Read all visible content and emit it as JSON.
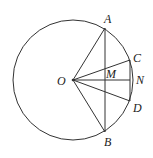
{
  "diagram": {
    "type": "geometry-circle",
    "circle": {
      "center": "O",
      "cx": 73,
      "cy": 80,
      "r": 60
    },
    "points": {
      "O": {
        "x": 73,
        "y": 80,
        "label": "O"
      },
      "A": {
        "x": 105,
        "y": 28,
        "label": "A"
      },
      "B": {
        "x": 105,
        "y": 132,
        "label": "B"
      },
      "C": {
        "x": 130,
        "y": 60,
        "label": "C"
      },
      "D": {
        "x": 130,
        "y": 101,
        "label": "D"
      },
      "M": {
        "x": 105,
        "y": 80,
        "label": "M"
      },
      "N": {
        "x": 133,
        "y": 80,
        "label": "N"
      }
    },
    "segments": [
      "OA",
      "OB",
      "OC",
      "OD",
      "ON",
      "AB",
      "CD"
    ],
    "colors": {
      "stroke": "#333333",
      "text": "#222222",
      "background": "#ffffff"
    }
  }
}
